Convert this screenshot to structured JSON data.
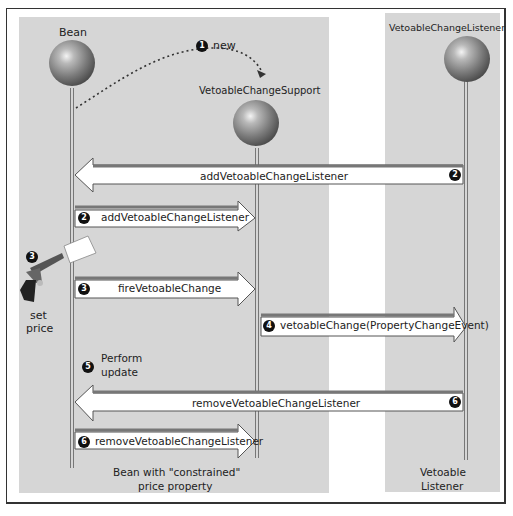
{
  "diagram": {
    "type": "sequence",
    "participants": [
      {
        "id": "bean",
        "label": "Bean"
      },
      {
        "id": "support",
        "label": "VetoableChangeSupport"
      },
      {
        "id": "listener",
        "label": "VetoableChangeListener"
      }
    ],
    "steps": [
      {
        "num": "1",
        "label": "new",
        "from": "bean",
        "to": "support",
        "style": "dotted-curve"
      },
      {
        "num": "2",
        "label": "addVetoableChangeListener",
        "from": "listener",
        "to": "bean"
      },
      {
        "num": "2",
        "label": "addVetoableChangeListener",
        "from": "bean",
        "to": "support"
      },
      {
        "num": "3",
        "label": "fireVetoableChange",
        "from": "bean",
        "to": "support"
      },
      {
        "num": "4",
        "label": "vetoableChange(PropertyChangeEvent)",
        "from": "support",
        "to": "listener"
      },
      {
        "num": "5",
        "label_line1": "Perform",
        "label_line2": "update",
        "at": "bean"
      },
      {
        "num": "6",
        "label": "removeVetoableChangeListener",
        "from": "listener",
        "to": "bean"
      },
      {
        "num": "6",
        "label": "removeVetoableChangeListener",
        "from": "bean",
        "to": "support"
      }
    ],
    "trigger": {
      "num": "3",
      "icon": "starter-pistol-icon",
      "label_line1": "set",
      "label_line2": "price"
    },
    "footers": {
      "bean_line1": "Bean with \"constrained\"",
      "bean_line2": "price property",
      "listener_line1": "Vetoable",
      "listener_line2": "Listener"
    },
    "colors": {
      "panel": "#d6d6d6",
      "arrow_fill": "#ffffff",
      "badge": "#111111",
      "outline": "#555555"
    }
  }
}
